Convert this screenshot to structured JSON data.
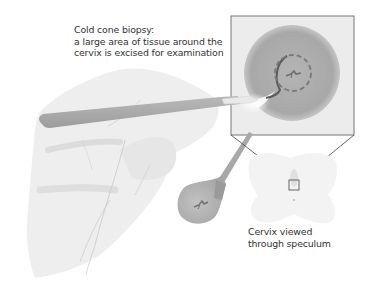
{
  "figure": {
    "title": "Cold cone biopsy",
    "captions": {
      "procedure": {
        "line1": "Cold cone biopsy:",
        "line2": "a large area of tissue around the",
        "line3": "cervix is excised for examination"
      },
      "view": {
        "line1": "Cervix viewed",
        "line2": "through speculum"
      }
    },
    "elements": [
      {
        "name": "hand",
        "description": "Gloved hand holding scalpel"
      },
      {
        "name": "scalpel",
        "description": "Scalpel cutting into cervix"
      },
      {
        "name": "magnified-cervix",
        "description": "Magnified view of cervix with dashed cone excision outline"
      },
      {
        "name": "excised-cone",
        "description": "Cone of tissue removed, held by forceps"
      },
      {
        "name": "speculum-view",
        "description": "Cervix viewed through speculum with zoom box"
      }
    ],
    "colors": {
      "tissue": "#a9a9a9",
      "tissue_light": "#c4c4c4",
      "hand": "#eeeeee",
      "box_border": "#555555",
      "text": "#333333",
      "dashed_outline": "#7a7a7a"
    }
  }
}
